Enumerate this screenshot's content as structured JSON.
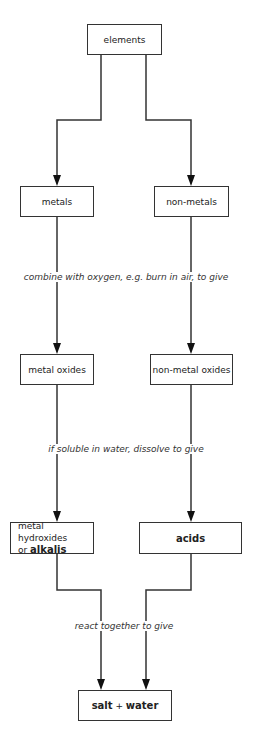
{
  "nodes": {
    "elements": "elements",
    "metals": "metals",
    "non_metals": "non-metals",
    "metal_oxides": "metal oxides",
    "non_metal_oxides": "non-metal oxides",
    "metal_hydroxides_line1": "metal hydroxides",
    "metal_hydroxides_or": "or ",
    "alkalis": "alkalis",
    "acids": "acids",
    "salt": "salt",
    "plus": " + ",
    "water": "water"
  },
  "edge_labels": {
    "combine": "combine with oxygen, e.g. burn in air, to give",
    "dissolve": "if soluble in water, dissolve to give",
    "react": "react together to give"
  }
}
